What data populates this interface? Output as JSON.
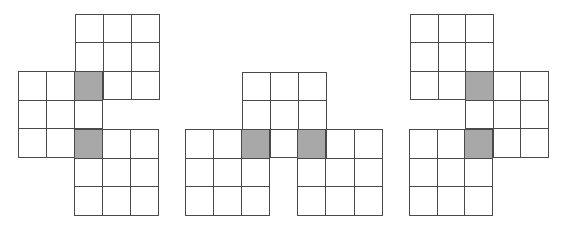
{
  "colors": {
    "line": "#4a4a4a",
    "shaded": "#a8a8a8",
    "background": "#ffffff"
  },
  "figures": [
    {
      "name": "figure-1",
      "blocks": [
        {
          "name": "top-block",
          "x": 75,
          "y": 14,
          "w": 85,
          "h": 86,
          "cells": [
            0,
            0,
            0,
            0,
            0,
            0,
            1,
            0,
            0
          ]
        },
        {
          "name": "left-block",
          "x": 18,
          "y": 71,
          "w": 85,
          "h": 87,
          "cells": [
            0,
            0,
            1,
            0,
            0,
            0,
            0,
            0,
            1
          ]
        },
        {
          "name": "bottom-block",
          "x": 74,
          "y": 129,
          "w": 85,
          "h": 87,
          "cells": [
            1,
            0,
            0,
            0,
            0,
            0,
            0,
            0,
            0
          ]
        }
      ]
    },
    {
      "name": "figure-2",
      "blocks": [
        {
          "name": "top-block",
          "x": 242,
          "y": 72,
          "w": 85,
          "h": 86,
          "cells": [
            0,
            0,
            0,
            0,
            0,
            0,
            1,
            0,
            1
          ]
        },
        {
          "name": "left-block",
          "x": 185,
          "y": 129,
          "w": 85,
          "h": 87,
          "cells": [
            0,
            0,
            1,
            0,
            0,
            0,
            0,
            0,
            0
          ]
        },
        {
          "name": "right-block",
          "x": 297,
          "y": 129,
          "w": 86,
          "h": 87,
          "cells": [
            1,
            0,
            0,
            0,
            0,
            0,
            0,
            0,
            0
          ]
        }
      ]
    },
    {
      "name": "figure-3",
      "blocks": [
        {
          "name": "top-block",
          "x": 410,
          "y": 14,
          "w": 84,
          "h": 86,
          "cells": [
            0,
            0,
            0,
            0,
            0,
            0,
            0,
            0,
            1
          ]
        },
        {
          "name": "right-block",
          "x": 465,
          "y": 71,
          "w": 84,
          "h": 87,
          "cells": [
            1,
            0,
            0,
            0,
            0,
            0,
            1,
            0,
            0
          ]
        },
        {
          "name": "bottom-block",
          "x": 409,
          "y": 129,
          "w": 84,
          "h": 87,
          "cells": [
            0,
            0,
            1,
            0,
            0,
            0,
            0,
            0,
            0
          ]
        }
      ]
    }
  ]
}
